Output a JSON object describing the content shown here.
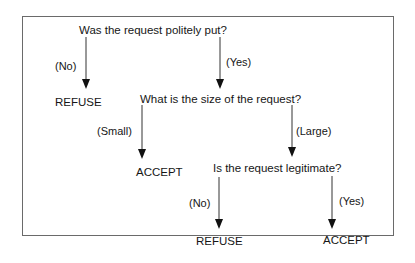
{
  "diagram": {
    "type": "decision-tree",
    "nodes": {
      "q1": {
        "text": "Was the request politely put?"
      },
      "q1_no": {
        "text": "REFUSE"
      },
      "q2": {
        "text": "What is the size of the request?"
      },
      "q2_small": {
        "text": "ACCEPT"
      },
      "q3": {
        "text": "Is the request legitimate?"
      },
      "q3_no": {
        "text": "REFUSE"
      },
      "q3_yes": {
        "text": "ACCEPT"
      }
    },
    "edges": {
      "q1_no": {
        "label": "(No)",
        "from": "q1",
        "to": "q1_no"
      },
      "q1_yes": {
        "label": "(Yes)",
        "from": "q1",
        "to": "q2"
      },
      "q2_small": {
        "label": "(Small)",
        "from": "q2",
        "to": "q2_small"
      },
      "q2_large": {
        "label": "(Large)",
        "from": "q2",
        "to": "q3"
      },
      "q3_no": {
        "label": "(No)",
        "from": "q3",
        "to": "q3_no"
      },
      "q3_yes": {
        "label": "(Yes)",
        "from": "q3",
        "to": "q3_yes"
      }
    },
    "colors": {
      "border": "#6a6a6a",
      "line": "#222222",
      "text": "#161616"
    }
  }
}
